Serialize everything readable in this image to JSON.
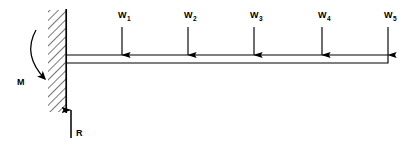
{
  "diagram": {
    "type": "engineering-free-body-diagram",
    "colors": {
      "line": "#000000",
      "hatch": "#555555",
      "background": "#ffffff"
    },
    "support": {
      "name": "fixed-wall-support",
      "style": "hatched",
      "x": 48,
      "y": 10,
      "width": 18,
      "height": 102,
      "face_x": 66
    },
    "beam": {
      "name": "cantilever-beam",
      "left_x": 66,
      "right_x": 388,
      "top_y": 55,
      "bottom_y": 63
    },
    "loads": [
      {
        "label": "W",
        "subscript": "1",
        "x": 122,
        "arrow_top": 27,
        "arrow_tip": 55,
        "label_x": 118,
        "label_y": 18
      },
      {
        "label": "W",
        "subscript": "2",
        "x": 188,
        "arrow_top": 27,
        "arrow_tip": 55,
        "label_x": 184,
        "label_y": 18
      },
      {
        "label": "W",
        "subscript": "3",
        "x": 254,
        "arrow_top": 27,
        "arrow_tip": 55,
        "label_x": 250,
        "label_y": 18
      },
      {
        "label": "W",
        "subscript": "4",
        "x": 322,
        "arrow_top": 27,
        "arrow_tip": 55,
        "label_x": 318,
        "label_y": 18
      },
      {
        "label": "W",
        "subscript": "5",
        "x": 388,
        "arrow_top": 27,
        "arrow_tip": 55,
        "label_x": 384,
        "label_y": 18
      }
    ],
    "reaction": {
      "name": "reaction-force-R",
      "label": "R",
      "x": 71,
      "arrow_tail_y": 138,
      "arrow_tip_y": 110,
      "label_x": 76,
      "label_y": 136
    },
    "moment": {
      "name": "moment-M",
      "label": "M",
      "label_x": 17,
      "label_y": 82,
      "arc_start_x": 36,
      "arc_start_y": 30,
      "arc_end_x": 45,
      "arc_end_y": 79,
      "arc_bulge_x": 22,
      "arc_bulge_y": 55
    }
  }
}
